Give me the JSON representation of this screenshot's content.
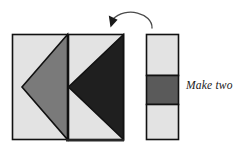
{
  "figure": {
    "caption": "Make two",
    "colors": {
      "light_gray": "#e3e3e3",
      "medium_gray": "#7a7a7a",
      "dark_gray": "#5a5a5a",
      "charcoal": "#1f1f1f",
      "outline": "#111111",
      "background": "#ffffff"
    },
    "units": {
      "block_left": {
        "name": "left-pieced-square",
        "x": 12,
        "y": 34,
        "width": 56,
        "height": 106,
        "background": "#e3e3e3",
        "triangle": {
          "name": "medium-gray-left-pointing-triangle",
          "fill": "#7a7a7a",
          "points": "68,34 22,87 68,140"
        }
      },
      "block_right": {
        "name": "right-pieced-square",
        "x": 68,
        "y": 34,
        "width": 56,
        "height": 106,
        "background": "#e3e3e3",
        "triangle": {
          "name": "charcoal-left-pointing-triangle",
          "fill": "#1f1f1f",
          "points": "124,34 68,87 124,140"
        }
      },
      "strip": {
        "name": "three-band-strip",
        "x": 146,
        "y": 34,
        "width": 33,
        "height": 106,
        "bands": [
          {
            "label": "top-light-band",
            "fill": "#e3e3e3",
            "y": 34,
            "height": 41
          },
          {
            "label": "middle-dark-band",
            "fill": "#5a5a5a",
            "y": 75,
            "height": 30
          },
          {
            "label": "bottom-light-band",
            "fill": "#e3e3e3",
            "y": 105,
            "height": 35
          }
        ]
      }
    },
    "arrow": {
      "name": "curved-rotation-arrow",
      "path": "M 152 27 C 151 12 124 6 112 20",
      "stroke": "#4a4a4a",
      "head_points": "112,27 108,16 117,18"
    }
  }
}
